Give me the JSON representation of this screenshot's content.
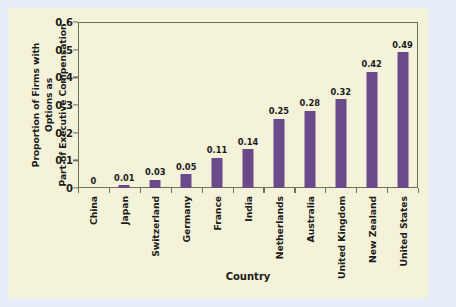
{
  "figure": {
    "background_color": "#f4f2d8",
    "page_background_color": "#e8eef7",
    "frame_color": "#6f6f5a"
  },
  "chart_data": {
    "type": "bar",
    "title": "",
    "xlabel": "Country",
    "ylabel": "Proportion of Firms with Options as Part of Executive Compensation",
    "ylabel_line1": "Proportion of Firms with Options as",
    "ylabel_line2": "Part of Executive Compensation",
    "categories": [
      "China",
      "Japan",
      "Switzerland",
      "Germany",
      "France",
      "India",
      "Netherlands",
      "Australia",
      "United Kingdom",
      "New Zealand",
      "United States"
    ],
    "values": [
      0,
      0.01,
      0.03,
      0.05,
      0.11,
      0.14,
      0.25,
      0.28,
      0.32,
      0.42,
      0.49
    ],
    "value_labels": [
      "0",
      "0.01",
      "0.03",
      "0.05",
      "0.11",
      "0.14",
      "0.25",
      "0.28",
      "0.32",
      "0.42",
      "0.49"
    ],
    "ylim": [
      0,
      0.6
    ],
    "ytick_values": [
      0,
      0.1,
      0.2,
      0.3,
      0.4,
      0.5,
      0.6
    ],
    "ytick_labels": [
      "0",
      "0.1",
      "0.2",
      "0.3",
      "0.4",
      "0.5",
      "0.6"
    ],
    "grid": false,
    "legend": null,
    "bar_color": "#6b4a8c",
    "series_name": "Proportion of Firms with Options as Part of Executive Compensation"
  }
}
